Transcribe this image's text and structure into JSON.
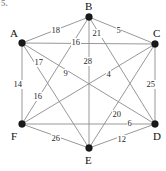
{
  "figure": {
    "problem_number": "5.",
    "width": 166,
    "height": 171,
    "edge_color": "#8c8c8c",
    "vertex_color": "#1a1a1a",
    "background": "#ffffff"
  },
  "chart_data": {
    "type": "diagram",
    "graph_type": "complete-weighted-graph",
    "title": "",
    "vertices": [
      {
        "id": "A",
        "label": "A",
        "x": 22,
        "y": 43,
        "label_x": 10,
        "label_y": 28
      },
      {
        "id": "B",
        "label": "B",
        "x": 89,
        "y": 17,
        "label_x": 85,
        "label_y": 1
      },
      {
        "id": "C",
        "label": "C",
        "x": 155,
        "y": 44,
        "label_x": 153,
        "label_y": 28
      },
      {
        "id": "D",
        "label": "D",
        "x": 155,
        "y": 124,
        "label_x": 153,
        "label_y": 131
      },
      {
        "id": "E",
        "label": "E",
        "x": 89,
        "y": 148,
        "label_x": 85,
        "label_y": 155
      },
      {
        "id": "F",
        "label": "F",
        "x": 22,
        "y": 124,
        "label_x": 11,
        "label_y": 131
      }
    ],
    "edges": [
      {
        "from": "A",
        "to": "B",
        "weight": 18,
        "label_x": 51,
        "label_y": 26
      },
      {
        "from": "A",
        "to": "C",
        "weight": 16,
        "label_x": 71,
        "label_y": 38
      },
      {
        "from": "A",
        "to": "D",
        "weight": 17,
        "label_x": 34,
        "label_y": 58
      },
      {
        "from": "A",
        "to": "E",
        "weight": 16,
        "label_x": 33,
        "label_y": 92
      },
      {
        "from": "A",
        "to": "F",
        "weight": 14,
        "label_x": 13,
        "label_y": 80
      },
      {
        "from": "B",
        "to": "C",
        "weight": 5,
        "label_x": 116,
        "label_y": 26
      },
      {
        "from": "B",
        "to": "E",
        "weight": 28,
        "label_x": 83,
        "label_y": 57
      },
      {
        "from": "B",
        "to": "F",
        "weight": 9,
        "label_x": 63,
        "label_y": 69
      },
      {
        "from": "B",
        "to": "D",
        "weight": 21,
        "label_x": 92,
        "label_y": 29
      },
      {
        "from": "C",
        "to": "D",
        "weight": 25,
        "label_x": 146,
        "label_y": 80
      },
      {
        "from": "C",
        "to": "F",
        "weight": 4,
        "label_x": 106,
        "label_y": 70
      },
      {
        "from": "C",
        "to": "E",
        "weight": 20,
        "label_x": 112,
        "label_y": 110
      },
      {
        "from": "D",
        "to": "F",
        "weight": 6,
        "label_x": 127,
        "label_y": 119
      },
      {
        "from": "D",
        "to": "E",
        "weight": 12,
        "label_x": 117,
        "label_y": 135
      },
      {
        "from": "E",
        "to": "F",
        "weight": 26,
        "label_x": 51,
        "label_y": 134
      }
    ],
    "visible_weight_labels": [
      18,
      16,
      21,
      5,
      17,
      28,
      9,
      4,
      25,
      14,
      16,
      20,
      6,
      26,
      12
    ]
  }
}
